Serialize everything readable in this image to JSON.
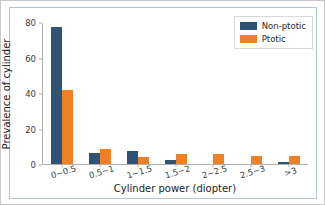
{
  "chart_data": {
    "type": "bar",
    "title": "",
    "xlabel": "Cylinder power (diopter)",
    "ylabel": "Prevalence of cylinder",
    "categories": [
      "0~0.5",
      "0.5~1",
      "1~1.5",
      "1.5~2",
      "2~2.5",
      "2.5~3",
      ">3"
    ],
    "series": [
      {
        "name": "Non-ptotic",
        "color": "#2f5374",
        "values": [
          78,
          6,
          7.5,
          2,
          0,
          0,
          1
        ]
      },
      {
        "name": "Ptotic",
        "color": "#ef8024",
        "values": [
          42,
          8.5,
          4,
          5.5,
          5.5,
          4.5,
          4.5
        ]
      }
    ],
    "ylim": [
      0,
      80
    ],
    "yticks": [
      0,
      20,
      40,
      60,
      80
    ],
    "ytick_labels": [
      "0",
      "20",
      "40",
      "60",
      "80"
    ],
    "grid": false,
    "legend_position": "upper right"
  },
  "legend": {
    "entries": [
      {
        "label": "Non-ptotic"
      },
      {
        "label": "Ptotic"
      }
    ]
  }
}
